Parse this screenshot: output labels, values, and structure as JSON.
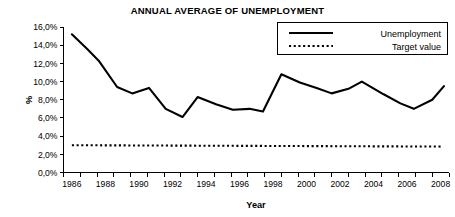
{
  "chart_data": {
    "type": "line",
    "title": "ANNUAL AVERAGE OF UNEMPLOYMENT",
    "xlabel": "Year",
    "ylabel": "%",
    "x": [
      1986,
      1987,
      1988,
      1989,
      1990,
      1991,
      1992,
      1993,
      1994,
      1995,
      1996,
      1997,
      1998,
      1999,
      2000,
      2001,
      2002,
      2003,
      2004,
      2005,
      2006,
      2007,
      2008
    ],
    "xlim": [
      1985.5,
      2008.5
    ],
    "ylim": [
      0.0,
      16.0
    ],
    "ytick_labels": [
      "0,0%",
      "2,0%",
      "4,0%",
      "6,0%",
      "8,0%",
      "10,0%",
      "12,0%",
      "14,0%",
      "16,0%"
    ],
    "ytick_values": [
      0.0,
      2.0,
      4.0,
      6.0,
      8.0,
      10.0,
      12.0,
      14.0,
      16.0
    ],
    "xtick_labels": [
      "1986",
      "1988",
      "1990",
      "1992",
      "1994",
      "1996",
      "1998",
      "2000",
      "2002",
      "2004",
      "2006",
      "2008"
    ],
    "xtick_values": [
      1986,
      1988,
      1990,
      1992,
      1994,
      1996,
      1998,
      2000,
      2002,
      2004,
      2006,
      2008
    ],
    "grid": false,
    "legend_position": "top-right",
    "series": [
      {
        "name": "Unemployment",
        "style": "solid",
        "color": "#000000",
        "values": [
          15.2,
          13.8,
          12.3,
          9.4,
          9.1,
          8.7,
          9.3,
          7.0,
          6.1,
          8.3,
          7.5,
          7.0,
          6.9,
          7.0,
          6.9,
          6.7,
          10.8,
          10.3,
          9.3,
          8.7,
          9.0,
          10.0,
          8.9
        ]
      },
      {
        "name": "Target value",
        "style": "dotted",
        "color": "#000000",
        "values": [
          3.0,
          3.0,
          3.0,
          3.0,
          3.0,
          3.0,
          3.0,
          3.0,
          3.0,
          3.0,
          3.0,
          3.0,
          3.0,
          3.0,
          3.0,
          3.0,
          3.0,
          3.0,
          3.0,
          3.0,
          3.0,
          3.0,
          2.9
        ]
      }
    ],
    "series_points": {
      "unemployment": [
        {
          "x": 1986.0,
          "y": 15.2
        },
        {
          "x": 1986.9,
          "y": 13.6
        },
        {
          "x": 1987.6,
          "y": 12.3
        },
        {
          "x": 1988.7,
          "y": 9.4
        },
        {
          "x": 1989.6,
          "y": 8.7
        },
        {
          "x": 1990.6,
          "y": 9.3
        },
        {
          "x": 1991.6,
          "y": 7.0
        },
        {
          "x": 1992.6,
          "y": 6.1
        },
        {
          "x": 1993.5,
          "y": 8.3
        },
        {
          "x": 1994.6,
          "y": 7.5
        },
        {
          "x": 1995.6,
          "y": 6.9
        },
        {
          "x": 1996.6,
          "y": 7.0
        },
        {
          "x": 1997.4,
          "y": 6.7
        },
        {
          "x": 1998.5,
          "y": 10.8
        },
        {
          "x": 1999.6,
          "y": 9.9
        },
        {
          "x": 2000.6,
          "y": 9.3
        },
        {
          "x": 2001.5,
          "y": 8.7
        },
        {
          "x": 2002.5,
          "y": 9.2
        },
        {
          "x": 2003.3,
          "y": 10.0
        },
        {
          "x": 2004.6,
          "y": 8.6
        },
        {
          "x": 2005.6,
          "y": 7.6
        },
        {
          "x": 2006.4,
          "y": 7.0
        },
        {
          "x": 2007.5,
          "y": 8.0
        },
        {
          "x": 2008.2,
          "y": 9.5
        }
      ],
      "target": [
        {
          "x": 1986.0,
          "y": 3.0
        },
        {
          "x": 2008.0,
          "y": 2.85
        }
      ]
    }
  },
  "legend": {
    "items": [
      {
        "label": "Unemployment",
        "style": "solid"
      },
      {
        "label": "Target value",
        "style": "dotted"
      }
    ]
  }
}
